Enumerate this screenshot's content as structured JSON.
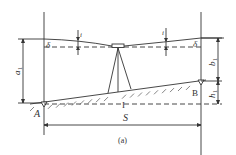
{
  "diagram": {
    "caption": "(a)",
    "labels": {
      "a1": "a",
      "a1_sub": "1",
      "b1": "b",
      "b1_sub": "1",
      "h1": "h",
      "h1_sub": "1",
      "point_a": "A",
      "point_b": "B",
      "distance": "S",
      "level_line": "I",
      "delta_left": "δ",
      "delta_right": "δ",
      "i_left": "i",
      "i_right": "i"
    },
    "colors": {
      "stroke": "#333333",
      "background": "#ffffff"
    }
  }
}
